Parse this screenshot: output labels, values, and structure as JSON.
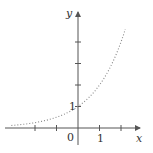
{
  "chart_data": {
    "type": "line",
    "title": "",
    "xlabel": "x",
    "ylabel": "y",
    "function": "exponential growth (approx. y = 2^x)",
    "line_style": "dotted",
    "x": [
      -3.1,
      -2,
      -1,
      0,
      1,
      2,
      2.2
    ],
    "values": [
      0.12,
      0.25,
      0.5,
      1,
      2,
      4,
      4.6
    ],
    "xlim": [
      -3.3,
      2.8
    ],
    "ylim": [
      -0.6,
      5.4
    ],
    "x_ticks": [
      -2,
      -1,
      0,
      1,
      2
    ],
    "y_ticks": [
      1,
      2,
      3,
      4
    ],
    "tick_labels": {
      "origin": "0",
      "x_one": "1",
      "y_one": "1"
    },
    "grid": false,
    "legend": null
  },
  "style": {
    "axis_color": "#555555",
    "curve_color": "#888888"
  }
}
